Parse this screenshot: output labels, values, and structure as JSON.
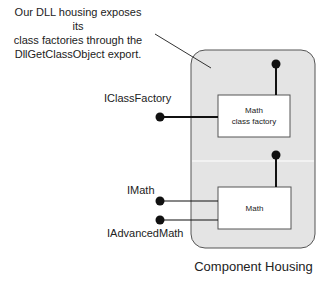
{
  "callout": {
    "lines": [
      "Our DLL housing exposes its",
      "class factories through the",
      "DllGetClassObject export."
    ]
  },
  "housing": {
    "label": "Component Housing",
    "fill_color": "#e4e4e4",
    "border_color": "#555555"
  },
  "components": [
    {
      "id": "class-factory",
      "lines": [
        "Math",
        "class factory"
      ],
      "interfaces": [
        "IClassFactory"
      ]
    },
    {
      "id": "math",
      "lines": [
        "Math"
      ],
      "interfaces": [
        "IMath",
        "IAdvancedMath"
      ]
    }
  ],
  "interfaces": {
    "iclassfactory": "IClassFactory",
    "imath": "IMath",
    "iadvancedmath": "IAdvancedMath"
  },
  "colors": {
    "line": "#111111",
    "box_fill": "#ffffff",
    "box_border": "#555555"
  }
}
